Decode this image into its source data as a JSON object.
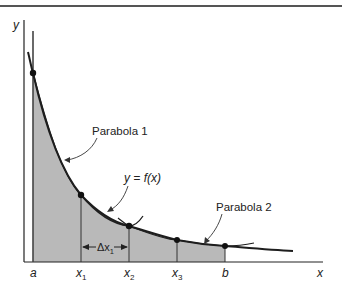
{
  "figure": {
    "axes": {
      "y_label": "y",
      "x_label": "x"
    },
    "tick_labels": {
      "a": "a",
      "x1": "x",
      "x1_sub": "1",
      "x2": "x",
      "x2_sub": "2",
      "x3": "x",
      "x3_sub": "3",
      "b": "b"
    },
    "annotations": {
      "parabola1": "Parabola 1",
      "parabola2": "Parabola 2",
      "function": "y = f(x)",
      "delta_prefix": "Δx",
      "delta_sub": "1"
    },
    "colors": {
      "shade": "#b9b9b9",
      "line": "#1e1e1e",
      "rule": "#555555"
    }
  }
}
